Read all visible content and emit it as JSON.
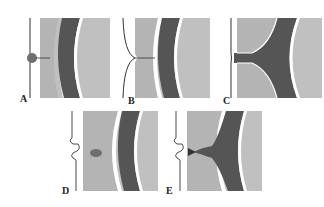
{
  "figure": {
    "panels": [
      {
        "id": "A",
        "label": "A",
        "description": "Small round bud on membrane with thin connector to light zone"
      },
      {
        "id": "B",
        "label": "B",
        "description": "Membrane pinched inward with thin thread crossing light zone"
      },
      {
        "id": "C",
        "label": "C",
        "description": "Dark channel connecting membrane through light zone to dark band"
      },
      {
        "id": "D",
        "label": "D",
        "description": "Wavy notched membrane with oval body in light zone"
      },
      {
        "id": "E",
        "label": "E",
        "description": "Wavy notched membrane with dark projection extending from dark band"
      }
    ],
    "colors": {
      "light_zone": "#b4b4b4",
      "dark_band": "#555555",
      "outer_zone": "#c0c0c0",
      "membrane": "#333333",
      "bud": "#6e6e6e"
    }
  }
}
